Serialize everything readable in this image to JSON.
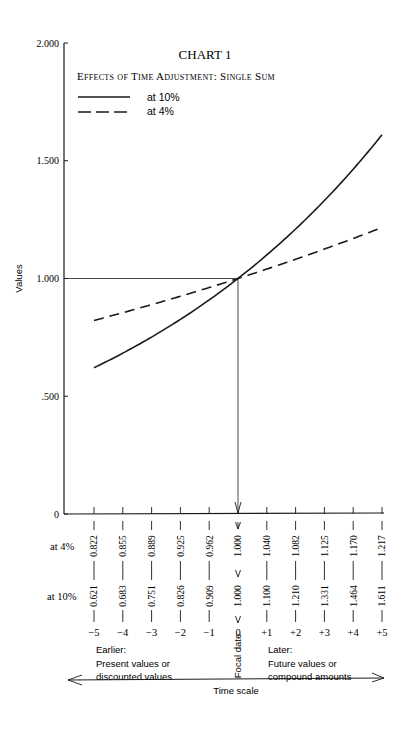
{
  "chart_data": {
    "type": "line",
    "title": "CHART 1",
    "subtitle": "Effects of Time Adjustment: Single Sum",
    "xlabel": "Time scale",
    "ylabel": "Values",
    "ylim": [
      0,
      2.0
    ],
    "yticks": [
      "0",
      ".500",
      "1.000",
      "1.500",
      "2.000"
    ],
    "x": [
      -5,
      -4,
      -3,
      -2,
      -1,
      0,
      1,
      2,
      3,
      4,
      5
    ],
    "x_tick_labels": [
      "−5",
      "−4",
      "−3",
      "−2",
      "−1",
      "0",
      "+1",
      "+2",
      "+3",
      "+4",
      "+5"
    ],
    "series": [
      {
        "name": "at 10%",
        "style": "solid",
        "values": [
          0.621,
          0.683,
          0.751,
          0.826,
          0.909,
          1.0,
          1.1,
          1.21,
          1.331,
          1.464,
          1.611
        ],
        "labels": [
          "0.621",
          "0.683",
          "0.751",
          "0.826",
          "0.909",
          "1.000",
          "1.100",
          "1.210",
          "1.331",
          "1.464",
          "1.611"
        ]
      },
      {
        "name": "at 4%",
        "style": "dashed",
        "values": [
          0.822,
          0.855,
          0.889,
          0.925,
          0.962,
          1.0,
          1.04,
          1.082,
          1.125,
          1.17,
          1.217
        ],
        "labels": [
          "0.822",
          "0.855",
          "0.889",
          "0.925",
          "0.962",
          "1.000",
          "1.040",
          "1.082",
          "1.125",
          "1.170",
          "1.217"
        ]
      }
    ],
    "legend": [
      {
        "label": "at 10%",
        "style": "solid"
      },
      {
        "label": "at  4%",
        "style": "dashed"
      }
    ],
    "legend_position": "top-left",
    "grid": false,
    "annotations": {
      "row_label_4": "at  4%",
      "row_label_10": "at 10%",
      "earlier": [
        "Earlier:",
        "Present values or",
        "discounted values"
      ],
      "later": [
        "Later:",
        "Future values or",
        "compound amounts"
      ],
      "focal": "Focal date"
    }
  }
}
